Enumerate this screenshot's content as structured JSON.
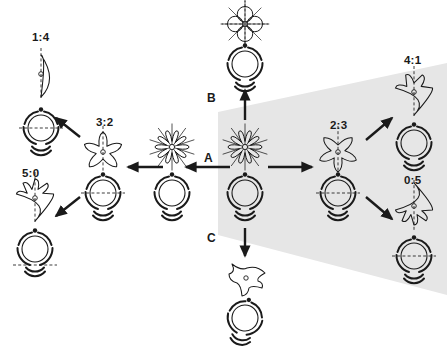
{
  "figure": {
    "type": "botanical-floral-symmetry-diagram",
    "background_color": "#ffffff",
    "stroke_color": "#1a1a1a",
    "shade_color": "#e6e6e6",
    "width": 447,
    "height": 348
  },
  "shaded_region": {
    "name": "highlight-wedge",
    "fill": "#e6e6e6",
    "points": "218,112 447,63 447,295 218,235"
  },
  "pathways": [
    {
      "id": "A",
      "label": "A",
      "direction": "left",
      "label_x": 204,
      "label_y": 152
    },
    {
      "id": "B",
      "label": "B",
      "direction": "up",
      "label_x": 207,
      "label_y": 92
    },
    {
      "id": "C",
      "label": "C",
      "direction": "down",
      "label_x": 207,
      "label_y": 232
    }
  ],
  "ancestor": {
    "name": "radially-symmetric-ancestor",
    "ratio_label": "",
    "symmetry": "actinomorphic",
    "cx": 245,
    "cy": 147,
    "petals": 10,
    "diagram_cx": 245,
    "diagram_cy": 193,
    "dashed_axis": "none"
  },
  "derived_forms": [
    {
      "id": "form-1-4",
      "ratio_label": "1:4",
      "upper_petals": 1,
      "lower_petals": 4,
      "label_x": 32,
      "label_y": 32,
      "flower_cx": 41,
      "flower_cy": 74,
      "diagram_cx": 41,
      "diagram_cy": 128,
      "dashed_axis": "horizontal",
      "shaded": false
    },
    {
      "id": "form-3-2",
      "ratio_label": "3:2",
      "upper_petals": 3,
      "lower_petals": 2,
      "label_x": 96,
      "label_y": 117,
      "flower_cx": 103,
      "flower_cy": 152,
      "diagram_cx": 103,
      "diagram_cy": 193,
      "dashed_axis": "horizontal",
      "shaded": false
    },
    {
      "id": "form-5-0",
      "ratio_label": "5:0",
      "upper_petals": 5,
      "lower_petals": 0,
      "label_x": 22,
      "label_y": 168,
      "flower_cx": 35,
      "flower_cy": 198,
      "diagram_cx": 35,
      "diagram_cy": 249,
      "dashed_axis": "horizontal-low",
      "shaded": false
    },
    {
      "id": "form-2-3",
      "ratio_label": "2:3",
      "upper_petals": 2,
      "lower_petals": 3,
      "label_x": 330,
      "label_y": 120,
      "flower_cx": 338,
      "flower_cy": 152,
      "diagram_cx": 338,
      "diagram_cy": 193,
      "dashed_axis": "horizontal",
      "shaded": true
    },
    {
      "id": "form-4-1",
      "ratio_label": "4:1",
      "upper_petals": 4,
      "lower_petals": 1,
      "label_x": 404,
      "label_y": 55,
      "flower_cx": 414,
      "flower_cy": 92,
      "diagram_cx": 414,
      "diagram_cy": 143,
      "dashed_axis": "none",
      "shaded": true
    },
    {
      "id": "form-0-5",
      "ratio_label": "0:5",
      "upper_petals": 0,
      "lower_petals": 5,
      "label_x": 404,
      "label_y": 175,
      "flower_cx": 414,
      "flower_cy": 206,
      "diagram_cx": 414,
      "diagram_cy": 256,
      "dashed_axis": "horizontal",
      "shaded": true
    },
    {
      "id": "form-b-tetramerous",
      "ratio_label": "",
      "upper_petals": 4,
      "lower_petals": 0,
      "label_x": 0,
      "label_y": 0,
      "flower_cx": 245,
      "flower_cy": 24,
      "diagram_cx": 245,
      "diagram_cy": 64,
      "dashed_axis": "horizontal",
      "shaded": false
    },
    {
      "id": "form-c-asymmetric",
      "ratio_label": "",
      "upper_petals": 0,
      "lower_petals": 0,
      "label_x": 0,
      "label_y": 0,
      "flower_cx": 245,
      "flower_cy": 277,
      "diagram_cx": 245,
      "diagram_cy": 318,
      "dashed_axis": "none",
      "shaded": false
    }
  ],
  "arrows": [
    {
      "name": "arrow-a-left-main",
      "x1": 230,
      "y1": 167,
      "x2": 186,
      "y2": 167,
      "thick": true
    },
    {
      "name": "arrow-a-left-inner",
      "x1": 163,
      "y1": 167,
      "x2": 128,
      "y2": 167,
      "thick": true
    },
    {
      "name": "arrow-b-up",
      "x1": 245,
      "y1": 120,
      "x2": 245,
      "y2": 90,
      "thick": true
    },
    {
      "name": "arrow-c-down",
      "x1": 245,
      "y1": 228,
      "x2": 245,
      "y2": 256,
      "thick": true
    },
    {
      "name": "arrow-right-main",
      "x1": 268,
      "y1": 167,
      "x2": 312,
      "y2": 167,
      "thick": true
    },
    {
      "name": "arrow-upright-4-1",
      "x1": 366,
      "y1": 140,
      "x2": 392,
      "y2": 118,
      "thick": true
    },
    {
      "name": "arrow-downright-0-5",
      "x1": 366,
      "y1": 197,
      "x2": 392,
      "y2": 219,
      "thick": true
    },
    {
      "name": "arrow-upleft-1-4",
      "x1": 80,
      "y1": 137,
      "x2": 56,
      "y2": 118,
      "thick": true
    },
    {
      "name": "arrow-downleft-5-0",
      "x1": 80,
      "y1": 197,
      "x2": 56,
      "y2": 216,
      "thick": true
    }
  ]
}
